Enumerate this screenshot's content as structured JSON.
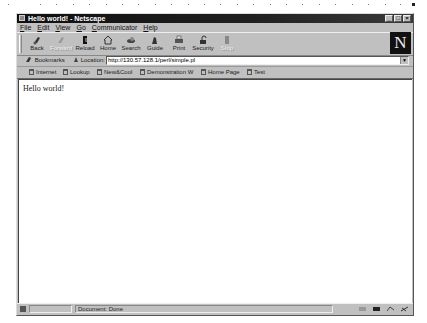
{
  "window": {
    "title": "Hello world! - Netscape",
    "controls": {
      "minimize": "_",
      "maximize": "□",
      "close": "×"
    }
  },
  "menubar": [
    "File",
    "Edit",
    "View",
    "Go",
    "Communicator",
    "Help"
  ],
  "toolbar": {
    "buttons": [
      {
        "label": "Back",
        "icon": "back-arrow-icon",
        "enabled": true
      },
      {
        "label": "Forward",
        "icon": "forward-arrow-icon",
        "enabled": false
      },
      {
        "label": "Reload",
        "icon": "reload-icon",
        "enabled": true
      },
      {
        "label": "Home",
        "icon": "home-icon",
        "enabled": true
      },
      {
        "label": "Search",
        "icon": "search-icon",
        "enabled": true
      },
      {
        "label": "Guide",
        "icon": "guide-icon",
        "enabled": true
      },
      {
        "label": "Print",
        "icon": "print-icon",
        "enabled": true
      },
      {
        "label": "Security",
        "icon": "security-lock-icon",
        "enabled": true
      },
      {
        "label": "Stop",
        "icon": "stop-icon",
        "enabled": false
      }
    ],
    "logo": "N"
  },
  "location": {
    "bookmarks_label": "Bookmarks",
    "location_label": "Location:",
    "url": "http://130.57.128.1/perl/simple.pl",
    "dropdown": "▼"
  },
  "personal_toolbar": [
    {
      "label": "Internet"
    },
    {
      "label": "Lookup"
    },
    {
      "label": "New&Cool"
    },
    {
      "label": "Demonstration W"
    },
    {
      "label": "Home Page"
    },
    {
      "label": "Test"
    }
  ],
  "content": {
    "text": "Hello world!"
  },
  "statusbar": {
    "text": "Document: Done"
  },
  "colors": {
    "chrome": "#c0c0c0",
    "titlebar": "#101010",
    "content_bg": "#ffffff"
  }
}
